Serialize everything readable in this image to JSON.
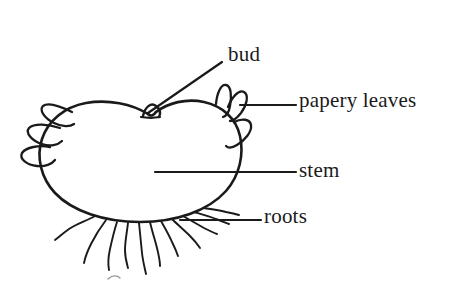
{
  "figure": {
    "background_color": "#ffffff",
    "ink_color": "#1a1a1a",
    "labels": [
      {
        "id": "bud",
        "text": "bud",
        "name": "label-bud"
      },
      {
        "id": "papery_leaves",
        "text": "papery leaves",
        "name": "label-papery-leaves"
      },
      {
        "id": "stem",
        "text": "stem",
        "name": "label-stem"
      },
      {
        "id": "roots",
        "text": "roots",
        "name": "label-roots"
      }
    ]
  }
}
